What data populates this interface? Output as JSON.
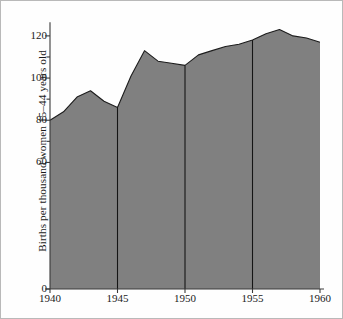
{
  "figure": {
    "background": "#fefefe",
    "frame_color": "#b9b9b9"
  },
  "chart_data": {
    "type": "area",
    "title": "",
    "subtitle": "",
    "xlabel": "",
    "ylabel": "Births per thousand women 15–44 years old",
    "xlim": [
      1940,
      1960
    ],
    "ylim": [
      0,
      128
    ],
    "grid": false,
    "legend": null,
    "fill_color": "#808080",
    "line_color": "#1c1c1c",
    "axis_color": "#3a3a3a",
    "x": [
      1940,
      1941,
      1942,
      1943,
      1944,
      1945,
      1946,
      1947,
      1948,
      1949,
      1950,
      1951,
      1952,
      1953,
      1954,
      1955,
      1956,
      1957,
      1958,
      1959,
      1960
    ],
    "values": [
      80,
      84,
      91,
      94,
      89,
      86,
      101,
      113,
      108,
      107,
      106,
      111,
      113,
      115,
      116,
      118,
      121,
      123,
      120,
      119,
      117
    ],
    "series": [
      {
        "name": "Births per thousand women 15-44 years old",
        "values": [
          80,
          84,
          91,
          94,
          89,
          86,
          101,
          113,
          108,
          107,
          106,
          111,
          113,
          115,
          116,
          118,
          121,
          123,
          120,
          119,
          117
        ]
      }
    ],
    "xticks": [
      1940,
      1945,
      1950,
      1955,
      1960
    ],
    "xtick_labels": [
      "1940",
      "1945",
      "1950",
      "1955",
      "1960"
    ],
    "yticks": [
      0,
      60,
      70,
      80,
      90,
      100,
      110,
      120
    ],
    "ytick_labels": [
      "0",
      "60",
      "",
      "80",
      "",
      "100",
      "",
      "120"
    ],
    "y_labeled_ticks": [
      {
        "value": 0,
        "label": "0"
      },
      {
        "value": 60,
        "label": "60"
      },
      {
        "value": 80,
        "label": "80"
      },
      {
        "value": 100,
        "label": "100"
      },
      {
        "value": 120,
        "label": "120"
      }
    ],
    "vertical_rules": [
      1945,
      1950,
      1955
    ],
    "annotations": []
  }
}
